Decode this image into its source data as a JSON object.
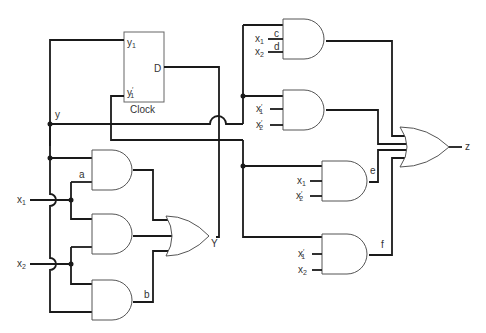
{
  "diagram": {
    "type": "sequential-logic-circuit",
    "flipflop": {
      "label_q": "y",
      "label_q_sub": "1",
      "label_qn": "y",
      "label_qn_sub": "1",
      "label_qn_prime": "′",
      "label_d": "D",
      "label_clock": "Clock"
    },
    "signals": {
      "y": "y",
      "Y": "Y",
      "z": "z",
      "a": "a",
      "b": "b",
      "c": "c",
      "d": "d",
      "e": "e",
      "f": "f"
    },
    "inputs": {
      "x1": "x",
      "x1_sub": "1",
      "x2": "x",
      "x2_sub": "2",
      "prime": "′"
    },
    "gates": {
      "left_and": [
        {
          "id": "and-a",
          "inputs": [
            "y",
            "x1"
          ],
          "output": "a"
        },
        {
          "id": "and-mid",
          "inputs": [
            "x1",
            "x2"
          ],
          "output": "mid"
        },
        {
          "id": "and-b",
          "inputs": [
            "x2",
            "y"
          ],
          "output": "b"
        }
      ],
      "left_or": {
        "id": "or-Y",
        "inputs": [
          "a",
          "mid",
          "b"
        ],
        "output": "Y"
      },
      "right_and": [
        {
          "id": "and-cd",
          "inputs": [
            "y1",
            "x1",
            "x2"
          ],
          "labels": [
            "c",
            "d"
          ]
        },
        {
          "id": "and-2",
          "inputs": [
            "y",
            "x1'",
            "x2'"
          ]
        },
        {
          "id": "and-e",
          "inputs": [
            "y'",
            "x1",
            "x2'"
          ],
          "output": "e"
        },
        {
          "id": "and-f",
          "inputs": [
            "y'",
            "x1'",
            "x2"
          ],
          "output": "f"
        }
      ],
      "right_or": {
        "id": "or-z",
        "output": "z"
      }
    }
  }
}
